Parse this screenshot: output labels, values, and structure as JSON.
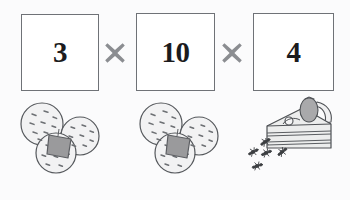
{
  "canvas": {
    "width": 350,
    "height": 200,
    "background_color": "#fbfbfc"
  },
  "equation": {
    "operands": [
      {
        "id": "box-1",
        "value": "3",
        "meaning": "three-cookie-packs"
      },
      {
        "id": "box-2",
        "value": "10",
        "meaning": "ten-cookies-per-pack"
      },
      {
        "id": "box-3",
        "value": "4",
        "meaning": "four-cake-slices"
      }
    ],
    "operators": [
      {
        "id": "times-1",
        "symbol": "×",
        "name": "multiply"
      },
      {
        "id": "times-2",
        "symbol": "×",
        "name": "multiply"
      }
    ],
    "expression": "3 × 10 × 4"
  },
  "illustrations": {
    "cookie_groups": [
      {
        "id": "cookies-1",
        "count": 3,
        "has_tag": true
      },
      {
        "id": "cookies-2",
        "count": 3,
        "has_tag": true
      }
    ],
    "cake": {
      "name": "strawberry-cake-slice",
      "topping": "strawberry",
      "layers": 3
    },
    "ants": {
      "name": "ant-trail",
      "count": 5
    }
  },
  "caption": {
    "text": "好噩很黏"
  },
  "colors": {
    "box_border": "#6f7277",
    "box_fill": "#ffffff",
    "number_text": "#1b1b1d",
    "operator": "#8b8d91",
    "cookie_fill": "#f2f2f3",
    "cookie_outline": "#55585c",
    "cookie_speck": "#6c6f73",
    "tag_fill": "#9a9a9c",
    "cake_fill": "#eceded",
    "cake_outline": "#4e5155",
    "strawberry_fill": "#a9a9ab",
    "ant_body": "#3c3e41",
    "caption_text": "#3a3a3c"
  }
}
